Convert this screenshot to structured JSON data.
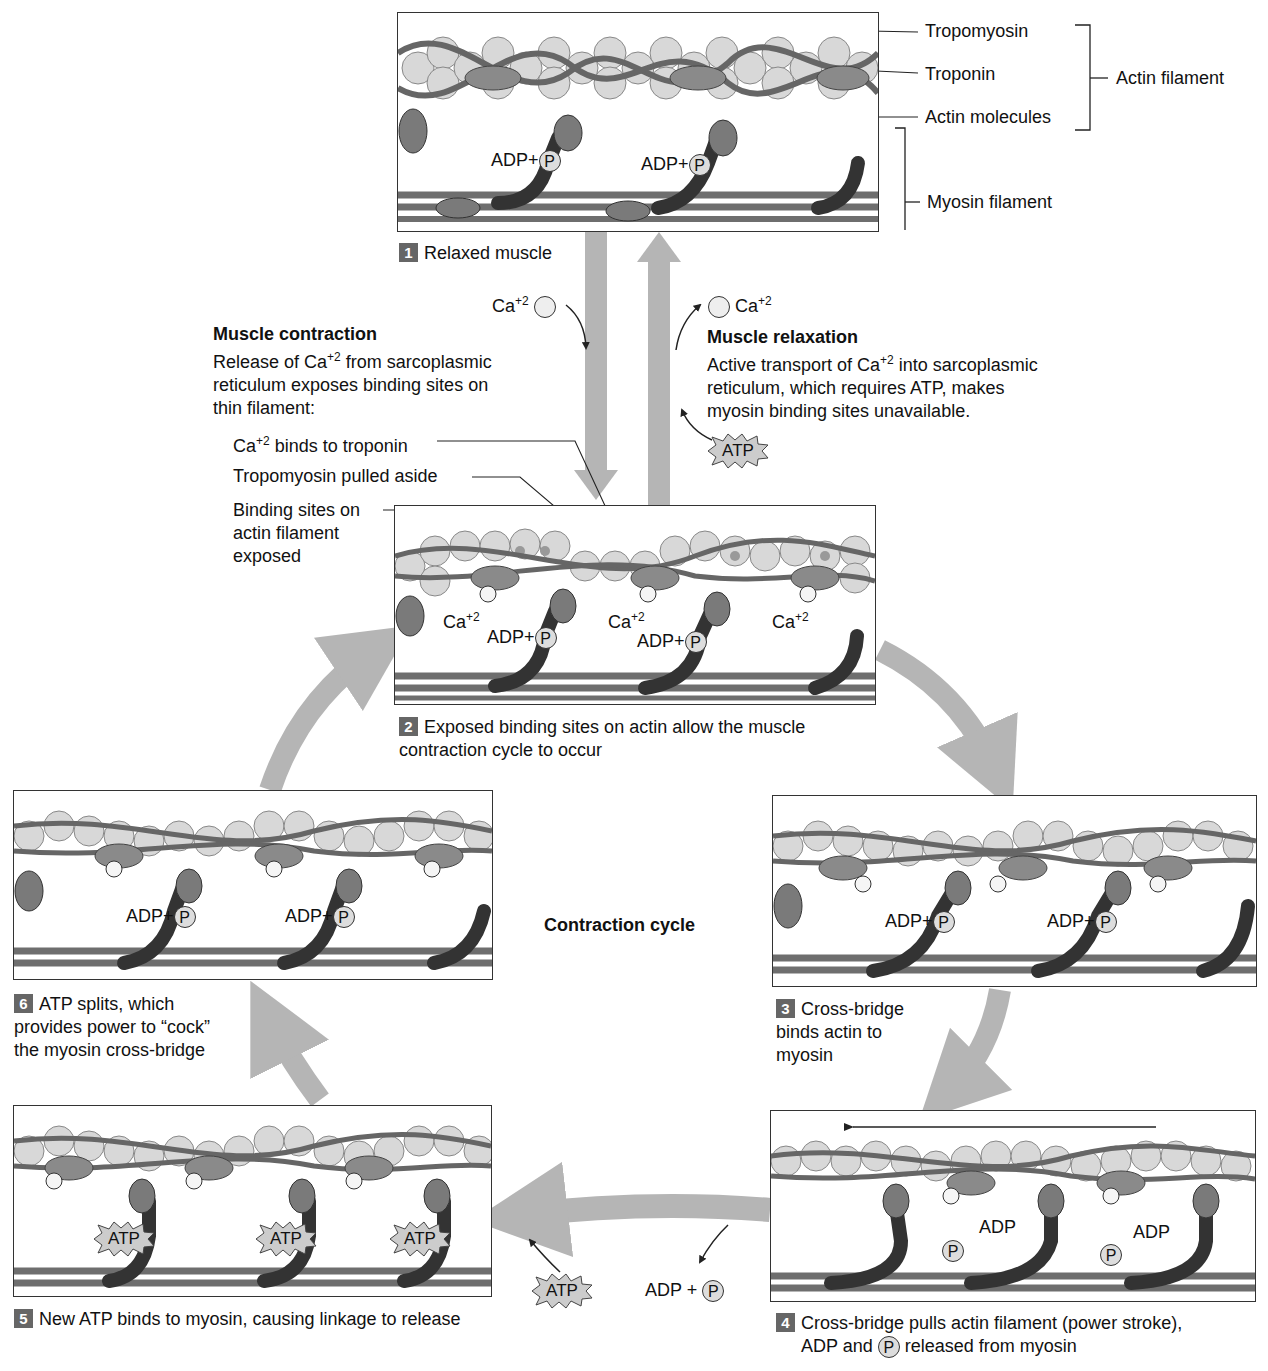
{
  "center_label": "Contraction cycle",
  "top_labels": {
    "tropomyosin": "Tropomyosin",
    "troponin": "Troponin",
    "actin_molecules": "Actin molecules",
    "actin_filament": "Actin filament",
    "myosin_filament": "Myosin filament"
  },
  "steps": [
    {
      "num": "1",
      "caption": "Relaxed muscle"
    },
    {
      "num": "2",
      "caption": "Exposed binding sites on actin allow the muscle contraction cycle to occur"
    },
    {
      "num": "3",
      "caption": "Cross-bridge binds actin to myosin"
    },
    {
      "num": "4",
      "caption_a": "Cross-bridge pulls actin filament (power stroke),",
      "caption_b_pre": "ADP and",
      "caption_b_post": "released from myosin"
    },
    {
      "num": "5",
      "caption": "New ATP binds to myosin, causing linkage to release"
    },
    {
      "num": "6",
      "caption": "ATP splits, which provides power to “cock” the myosin cross-bridge"
    }
  ],
  "contraction": {
    "heading": "Muscle contraction",
    "line1_pre": "Release of Ca",
    "line1_sup": "+2",
    "line1_post": " from sarcoplasmic",
    "line2": "reticulum exposes binding sites on",
    "line3": "thin filament:",
    "points": {
      "ca_binds_pre": "Ca",
      "ca_binds_sup": "+2",
      "ca_binds_post": " binds to troponin",
      "tropomyosin_pulled": "Tropomyosin pulled aside",
      "binding_sites_1": "Binding sites on",
      "binding_sites_2": "actin filament",
      "binding_sites_3": "exposed"
    }
  },
  "relaxation": {
    "heading": "Muscle relaxation",
    "line1_pre": "Active transport of Ca",
    "line1_sup": "+2",
    "line1_post": " into sarcoplasmic",
    "line2": "reticulum, which requires ATP, makes",
    "line3": "myosin binding sites unavailable."
  },
  "ions": {
    "ca": "Ca",
    "ca_sup": "+2"
  },
  "molecules": {
    "adp_plus": "ADP+",
    "adp": "ADP",
    "adp_plus_spaced": "ADP +",
    "p": "P",
    "atp": "ATP"
  },
  "colors": {
    "arrow": "#b5b5b5",
    "filament": "#6e6e6e",
    "actin_bead": "#dcdcdc",
    "troponin": "#8a8a8a",
    "number_badge": "#666666"
  }
}
